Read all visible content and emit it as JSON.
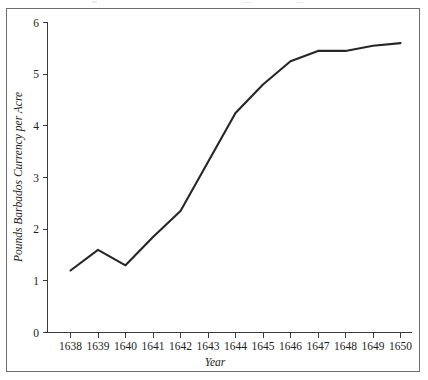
{
  "chart_data": {
    "type": "line",
    "title": "",
    "subtitle": "",
    "xlabel": "Year",
    "ylabel": "Pounds Barbados Currency per Acre",
    "x": [
      1638,
      1639,
      1640,
      1641,
      1642,
      1643,
      1644,
      1645,
      1646,
      1647,
      1648,
      1649,
      1650
    ],
    "values": [
      1.2,
      1.6,
      1.3,
      1.85,
      2.35,
      3.3,
      4.25,
      4.8,
      5.25,
      5.45,
      5.45,
      5.55,
      5.6
    ],
    "series": [
      {
        "name": "Pounds Barbados Currency per Acre",
        "values": [
          1.2,
          1.6,
          1.3,
          1.85,
          2.35,
          3.3,
          4.25,
          4.8,
          5.25,
          5.45,
          5.45,
          5.55,
          5.6
        ]
      }
    ],
    "xlim": [
      1637.5,
      1650.5
    ],
    "ylim": [
      0,
      6
    ],
    "xticks": [
      "1638",
      "1639",
      "1640",
      "1641",
      "1642",
      "1643",
      "1644",
      "1645",
      "1646",
      "1647",
      "1648",
      "1649",
      "1650"
    ],
    "yticks": [
      "0",
      "1",
      "2",
      "3",
      "4",
      "5",
      "6"
    ],
    "grid": false,
    "legend": "none",
    "line_color": "#262626",
    "axis_color": "#3a3a3a",
    "frame_color": "#6f6f6f",
    "background": "#ffffff"
  }
}
